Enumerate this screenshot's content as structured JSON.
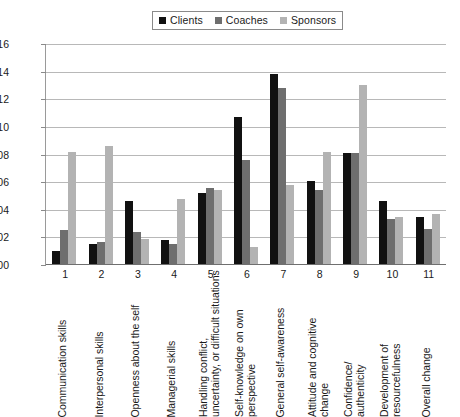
{
  "legend": {
    "position": "top-center",
    "items": [
      {
        "label": "Clients",
        "color": "#111111"
      },
      {
        "label": "Coaches",
        "color": "#6e6e6e"
      },
      {
        "label": "Sponsors",
        "color": "#b3b3b3"
      }
    ]
  },
  "axis": {
    "y_ticks": [
      "0,16",
      "0,14",
      "0,12",
      "0,10",
      "0,08",
      "0,06",
      "0,04",
      "0,02",
      "0,00"
    ],
    "x_numbers": [
      "1",
      "2",
      "3",
      "4",
      "5",
      "6",
      "7",
      "8",
      "9",
      "10",
      "11"
    ]
  },
  "x_labels": [
    {
      "line1": "Communication skills",
      "line2": ""
    },
    {
      "line1": "Interpersonal skills",
      "line2": ""
    },
    {
      "line1": "Openness about the self",
      "line2": ""
    },
    {
      "line1": "Managerial skills",
      "line2": ""
    },
    {
      "line1": "Handling conflict,",
      "line2": "uncertainty, or difficult situations"
    },
    {
      "line1": "Self-knowledge on own",
      "line2": "perspective"
    },
    {
      "line1": "General self-awareness",
      "line2": ""
    },
    {
      "line1": "Attitude and cognitive",
      "line2": "change"
    },
    {
      "line1": "Confidence/",
      "line2": "authenticity"
    },
    {
      "line1": "Development of",
      "line2": "resourcefulness"
    },
    {
      "line1": "Overall change",
      "line2": ""
    }
  ],
  "chart_data": {
    "type": "bar",
    "title": "",
    "subtitle": "",
    "xlabel": "",
    "ylabel": "",
    "ylim": [
      0,
      0.16
    ],
    "ytick_step": 0.02,
    "grid": true,
    "legend_position": "top-center",
    "categories": [
      "1 Communication skills",
      "2 Interpersonal skills",
      "3 Openness about the self",
      "4 Managerial skills",
      "5 Handling conflict, uncertainty, or difficult situations",
      "6 Self-knowledge on own perspective",
      "7 General self-awareness",
      "8 Attitude and cognitive change",
      "9 Confidence/authenticity",
      "10 Development of resourcefulness",
      "11 Overall change"
    ],
    "series": [
      {
        "name": "Clients",
        "color": "#111111",
        "values": [
          0.01,
          0.015,
          0.046,
          0.018,
          0.052,
          0.107,
          0.138,
          0.061,
          0.081,
          0.046,
          0.035
        ]
      },
      {
        "name": "Coaches",
        "color": "#6e6e6e",
        "values": [
          0.025,
          0.017,
          0.024,
          0.015,
          0.056,
          0.076,
          0.128,
          0.054,
          0.081,
          0.033,
          0.026
        ]
      },
      {
        "name": "Sponsors",
        "color": "#b3b3b3",
        "values": [
          0.082,
          0.086,
          0.019,
          0.048,
          0.054,
          0.013,
          0.058,
          0.082,
          0.13,
          0.035,
          0.037
        ]
      }
    ]
  }
}
